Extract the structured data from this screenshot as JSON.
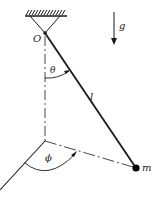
{
  "diagram": {
    "colors": {
      "ink": "#1a1a1a",
      "background": "#ffffff"
    },
    "labels": {
      "pivot": "O",
      "gravity": "g",
      "polar_angle": "θ",
      "length": "l",
      "azimuth_angle": "ϕ",
      "mass": "m"
    },
    "elements": {
      "support": {
        "type": "hatched-ceiling-with-triangle"
      },
      "rod": {
        "from": "O",
        "to": "m"
      },
      "vertical_axis": {
        "style": "dash-dot"
      },
      "projection_line": {
        "style": "dash-dot"
      },
      "reference_axis": {
        "style": "solid"
      },
      "gravity_arrow": {
        "direction": "down"
      }
    }
  }
}
